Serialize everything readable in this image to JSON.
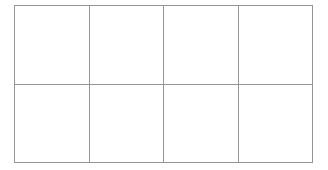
{
  "document": {
    "background_color": "#ffffff",
    "table": {
      "rows": 2,
      "columns": 4,
      "border_color": "#939598",
      "cell_background": "#ffffff",
      "cells": [
        [
          "",
          "",
          "",
          ""
        ],
        [
          "",
          "",
          "",
          ""
        ]
      ]
    }
  }
}
